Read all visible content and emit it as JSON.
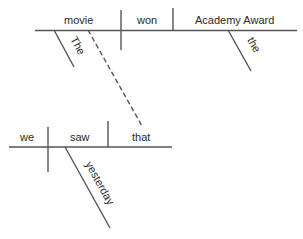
{
  "diagram": {
    "type": "Reichenbach sentence diagram",
    "main_clause": {
      "subject": "movie",
      "verb": "won",
      "object": "Academy Award",
      "subject_modifier": "The",
      "object_modifier": "the"
    },
    "relative_clause": {
      "subject": "we",
      "verb": "saw",
      "object": "that",
      "verb_modifier": "yesterday"
    },
    "connector": "dashed line linking 'movie' to 'that'",
    "colors": {
      "line": "#555555",
      "text": "#2a2a2a",
      "background": "#ffffff"
    }
  }
}
